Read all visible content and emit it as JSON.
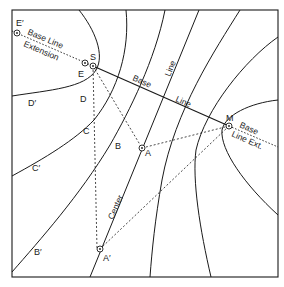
{
  "figure": {
    "type": "hyperbolic navigation lattice (LORAN-style)",
    "colors": {
      "ink": "#1a1a1a",
      "background": "#ffffff"
    }
  },
  "stations": {
    "S": {
      "label": "S",
      "x": 93,
      "y": 66
    },
    "M": {
      "label": "M",
      "x": 229,
      "y": 126
    }
  },
  "points": {
    "E_prime": {
      "label": "E′",
      "x": 17,
      "y": 33
    },
    "E": {
      "label": "E",
      "x": 85,
      "y": 63
    },
    "A": {
      "label": "A",
      "x": 142,
      "y": 148
    },
    "A_prime": {
      "label": "A′",
      "x": 100,
      "y": 249
    }
  },
  "line_labels": {
    "baseline_extension_1": "Base Line",
    "baseline_extension_2": "Extension",
    "baseline_1": "Base",
    "baseline_2": "Line",
    "baseline_3": "Line",
    "baseline_ext_right_1": "Base",
    "baseline_ext_right_2": "Line Ext.",
    "center": "Center"
  },
  "curve_labels": {
    "D": "D",
    "D_prime": "D′",
    "C": "C",
    "C_prime": "C′",
    "B": "B",
    "B_prime": "B′"
  }
}
